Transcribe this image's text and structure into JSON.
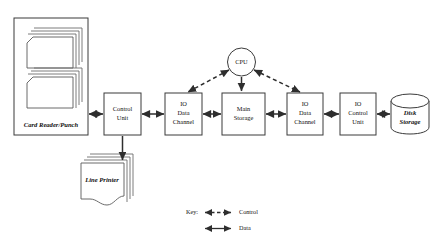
{
  "figure": {
    "kind": "block-diagram",
    "background_color": "#ffffff",
    "line_color": "#2e2e2e"
  },
  "nodes": {
    "card_reader": {
      "label": "Card Reader/Punch",
      "shape": "enclosure-with-card-stacks"
    },
    "line_printer": {
      "label": "Line Printer",
      "shape": "document-stack"
    },
    "control_unit_left": {
      "label_line1": "Control",
      "label_line2": "Unit",
      "shape": "rect"
    },
    "io_data_channel_left": {
      "label_line1": "IO",
      "label_line2": "Data",
      "label_line3": "Channel",
      "shape": "rect"
    },
    "main_storage": {
      "label_line1": "Main",
      "label_line2": "Storage",
      "shape": "rect"
    },
    "io_data_channel_right": {
      "label_line1": "IO",
      "label_line2": "Data",
      "label_line3": "Channel",
      "shape": "rect"
    },
    "io_control_unit": {
      "label_line1": "IO",
      "label_line2": "Control",
      "label_line3": "Unit",
      "shape": "rect"
    },
    "cpu": {
      "label": "CPU",
      "shape": "circle"
    },
    "disk_storage": {
      "label_line1": "Disk",
      "label_line2": "Storage",
      "shape": "cylinder"
    }
  },
  "legend": {
    "title": "Key:",
    "entries": [
      {
        "label": "Control",
        "line_style": "dashed",
        "arrow": "double"
      },
      {
        "label": "Data",
        "line_style": "solid",
        "arrow": "double"
      }
    ]
  }
}
